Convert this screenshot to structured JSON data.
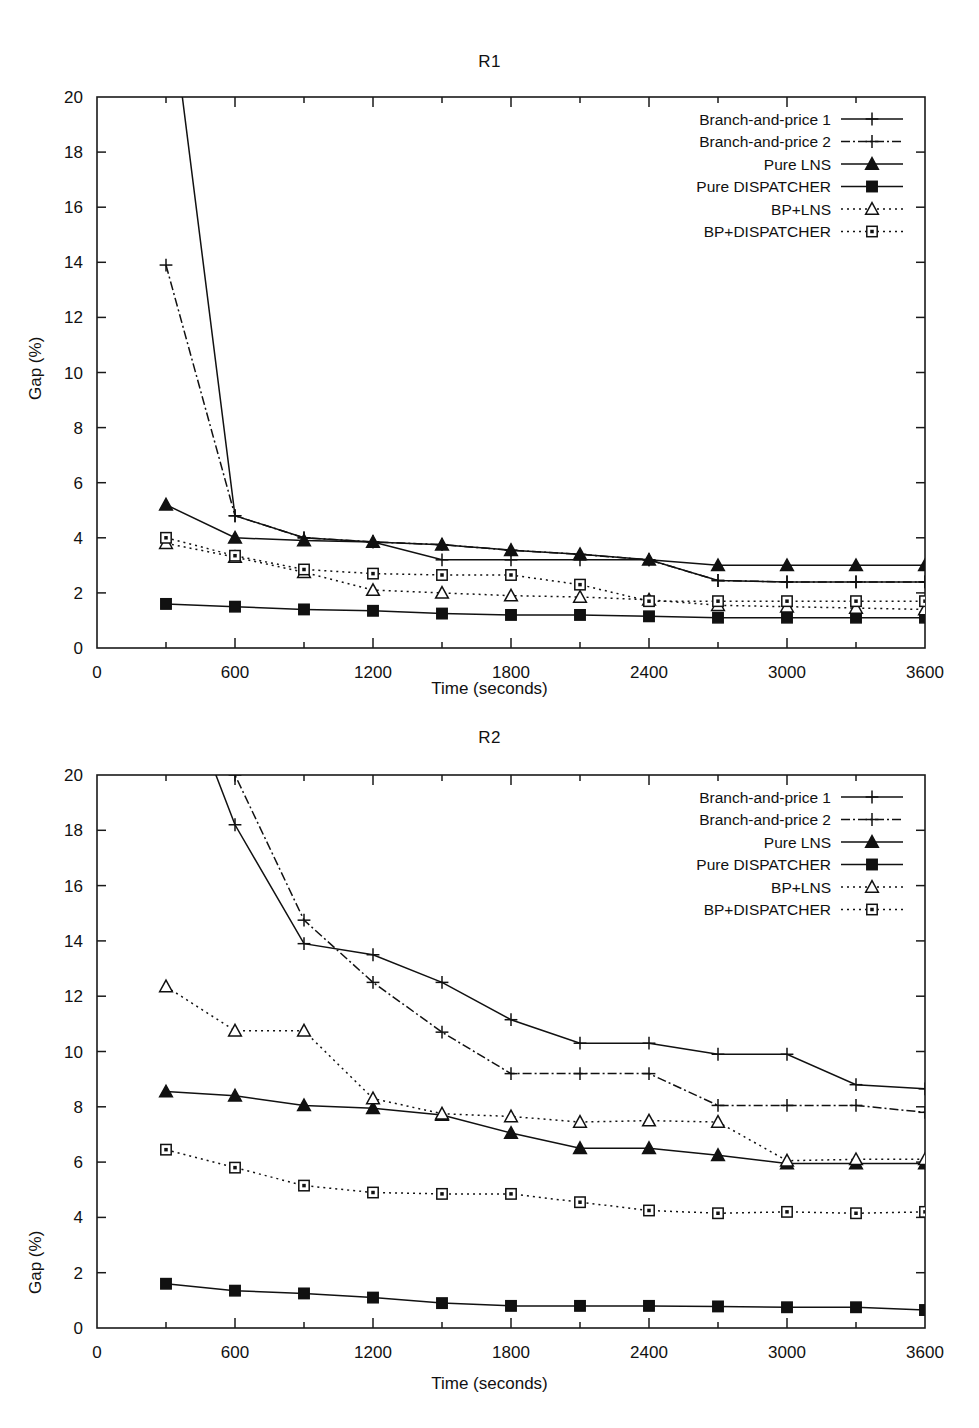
{
  "figures": [
    {
      "id": "r1",
      "title": "R1",
      "chart_data": {
        "type": "line",
        "title": "R1",
        "xlabel": "Time (seconds)",
        "ylabel": "Gap (%)",
        "xlim": [
          0,
          3600
        ],
        "ylim": [
          0,
          20
        ],
        "xticks": [
          0,
          600,
          1200,
          1800,
          2400,
          3000,
          3600
        ],
        "xticklabels": [
          "0",
          "600",
          "1200",
          "1800",
          "2400",
          "3000",
          "3600"
        ],
        "xminorticks": [
          300,
          900,
          1500,
          2100,
          2700,
          3300
        ],
        "yticks": [
          0,
          2,
          4,
          6,
          8,
          10,
          12,
          14,
          16,
          18,
          20
        ],
        "yticklabels": [
          "0",
          "2",
          "4",
          "6",
          "8",
          "10",
          "12",
          "14",
          "16",
          "18",
          "20"
        ],
        "grid": false,
        "legend_position": "top-right",
        "x": [
          300,
          600,
          900,
          1200,
          1500,
          1800,
          2100,
          2400,
          2700,
          3000,
          3300,
          3600
        ],
        "series": [
          {
            "name": "Branch-and-price 1",
            "marker": "plus",
            "dash": "solid",
            "values": [
              null,
              4.8,
              4.0,
              3.85,
              3.2,
              3.2,
              3.2,
              3.2,
              2.45,
              2.4,
              2.4,
              2.4
            ]
          },
          {
            "name": "Branch-and-price 2",
            "marker": "plus",
            "dash": "dashdot",
            "values": [
              13.9,
              4.8,
              4.0,
              3.85,
              3.75,
              3.55,
              3.4,
              3.2,
              2.45,
              2.4,
              2.4,
              2.4
            ]
          },
          {
            "name": "Pure LNS",
            "marker": "triangle-filled",
            "dash": "solid",
            "values": [
              5.2,
              4.0,
              3.9,
              3.85,
              3.75,
              3.55,
              3.4,
              3.2,
              3.0,
              3.0,
              3.0,
              3.0
            ]
          },
          {
            "name": "Pure DISPATCHER",
            "marker": "square-filled",
            "dash": "solid",
            "values": [
              1.6,
              1.5,
              1.4,
              1.35,
              1.25,
              1.2,
              1.2,
              1.15,
              1.1,
              1.1,
              1.1,
              1.1
            ]
          },
          {
            "name": "BP+LNS",
            "marker": "triangle-open",
            "dash": "dotted",
            "values": [
              3.8,
              3.3,
              2.75,
              2.1,
              2.0,
              1.9,
              1.85,
              1.75,
              1.55,
              1.5,
              1.45,
              1.4
            ]
          },
          {
            "name": "BP+DISPATCHER",
            "marker": "square-open",
            "dash": "dotted",
            "values": [
              4.0,
              3.35,
              2.85,
              2.7,
              2.65,
              2.65,
              2.3,
              1.7,
              1.7,
              1.7,
              1.7,
              1.7
            ]
          }
        ]
      }
    },
    {
      "id": "r2",
      "title": "R2",
      "chart_data": {
        "type": "line",
        "title": "R2",
        "xlabel": "Time (seconds)",
        "ylabel": "Gap (%)",
        "xlim": [
          0,
          3600
        ],
        "ylim": [
          0,
          20
        ],
        "xticks": [
          0,
          600,
          1200,
          1800,
          2400,
          3000,
          3600
        ],
        "xticklabels": [
          "0",
          "600",
          "1200",
          "1800",
          "2400",
          "3000",
          "3600"
        ],
        "xminorticks": [
          300,
          900,
          1500,
          2100,
          2700,
          3300
        ],
        "yticks": [
          0,
          2,
          4,
          6,
          8,
          10,
          12,
          14,
          16,
          18,
          20
        ],
        "yticklabels": [
          "0",
          "2",
          "4",
          "6",
          "8",
          "10",
          "12",
          "14",
          "16",
          "18",
          "20"
        ],
        "grid": false,
        "legend_position": "top-right",
        "x": [
          300,
          600,
          900,
          1200,
          1500,
          1800,
          2100,
          2400,
          2700,
          3000,
          3300,
          3600
        ],
        "series": [
          {
            "name": "Branch-and-price 1",
            "marker": "plus",
            "dash": "solid",
            "values": [
              null,
              18.2,
              13.9,
              13.5,
              12.5,
              11.15,
              10.3,
              10.3,
              9.9,
              9.9,
              8.8,
              8.65
            ]
          },
          {
            "name": "Branch-and-price 2",
            "marker": "plus",
            "dash": "dashdot",
            "values": [
              null,
              20.0,
              14.75,
              12.5,
              10.7,
              9.2,
              9.2,
              9.2,
              8.05,
              8.05,
              8.05,
              7.8
            ]
          },
          {
            "name": "Pure LNS",
            "marker": "triangle-filled",
            "dash": "solid",
            "values": [
              8.55,
              8.4,
              8.05,
              7.95,
              7.7,
              7.05,
              6.5,
              6.5,
              6.25,
              5.95,
              5.95,
              5.95
            ]
          },
          {
            "name": "Pure DISPATCHER",
            "marker": "square-filled",
            "dash": "solid",
            "values": [
              1.6,
              1.35,
              1.25,
              1.1,
              0.9,
              0.8,
              0.8,
              0.8,
              0.78,
              0.75,
              0.75,
              0.65
            ]
          },
          {
            "name": "BP+LNS",
            "marker": "triangle-open",
            "dash": "dotted",
            "values": [
              12.35,
              10.75,
              10.75,
              8.3,
              7.75,
              7.65,
              7.45,
              7.5,
              7.45,
              6.05,
              6.1,
              6.1
            ]
          },
          {
            "name": "BP+DISPATCHER",
            "marker": "square-open",
            "dash": "dotted",
            "values": [
              6.45,
              5.8,
              5.15,
              4.9,
              4.85,
              4.85,
              4.55,
              4.25,
              4.15,
              4.2,
              4.15,
              4.2
            ]
          }
        ]
      }
    }
  ]
}
